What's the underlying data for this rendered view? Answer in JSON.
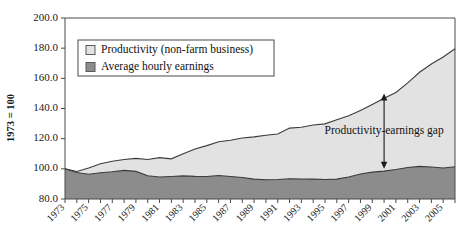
{
  "chart_data": {
    "type": "area",
    "title": "",
    "xlabel": "",
    "ylabel": "1973 = 100",
    "ylim": [
      80.0,
      200.0
    ],
    "ytick_values": [
      80.0,
      100.0,
      120.0,
      140.0,
      160.0,
      180.0,
      200.0
    ],
    "ytick_labels": [
      "80.0",
      "100.0",
      "120.0",
      "140.0",
      "160.0",
      "180.0",
      "200.0"
    ],
    "xlim": [
      1973,
      2006
    ],
    "grid": false,
    "legend_position": "top-left-inside",
    "x": [
      1973,
      1974,
      1975,
      1976,
      1977,
      1978,
      1979,
      1980,
      1981,
      1982,
      1983,
      1984,
      1985,
      1986,
      1987,
      1988,
      1989,
      1990,
      1991,
      1992,
      1993,
      1994,
      1995,
      1996,
      1997,
      1998,
      1999,
      2000,
      2001,
      2002,
      2003,
      2004,
      2005,
      2006
    ],
    "xtick_labels": [
      "1973",
      "1975",
      "1977",
      "1979",
      "1981",
      "1983",
      "1985",
      "1987",
      "1989",
      "1991",
      "1993",
      "1995",
      "1997",
      "1999",
      "2001",
      "2003",
      "2005"
    ],
    "series": [
      {
        "name": "Productivity (non-farm business)",
        "color": "#e2e2e2",
        "edge_color": "#3c3c3c",
        "values": [
          100.0,
          98.2,
          100.6,
          103.4,
          105.0,
          106.2,
          106.9,
          106.2,
          107.4,
          106.6,
          110.0,
          113.2,
          115.4,
          118.0,
          119.0,
          120.4,
          121.2,
          122.3,
          123.1,
          127.0,
          127.6,
          129.1,
          129.8,
          132.6,
          135.2,
          138.6,
          142.6,
          146.8,
          150.6,
          157.0,
          164.0,
          169.5,
          174.2,
          179.6
        ]
      },
      {
        "name": "Average hourly earnings",
        "color": "#8c8c8c",
        "edge_color": "#3c3c3c",
        "values": [
          100.0,
          97.6,
          96.4,
          97.4,
          98.1,
          99.0,
          98.3,
          95.4,
          94.6,
          94.9,
          95.3,
          95.0,
          94.9,
          95.6,
          94.9,
          94.3,
          93.2,
          92.8,
          92.9,
          93.4,
          93.3,
          93.2,
          92.9,
          93.2,
          94.6,
          96.6,
          97.8,
          98.5,
          99.6,
          100.9,
          101.6,
          101.2,
          100.6,
          101.4
        ]
      }
    ],
    "annotations": [
      {
        "text": "Productivity-earnings gap",
        "type": "double-arrow-label",
        "x_year": 2000,
        "y_top": 150.0,
        "y_bottom": 100.0
      }
    ]
  },
  "legend": {
    "items": [
      {
        "label": "Productivity (non-farm business)",
        "swatch": "#e2e2e2"
      },
      {
        "label": "Average hourly earnings",
        "swatch": "#8c8c8c"
      }
    ]
  }
}
